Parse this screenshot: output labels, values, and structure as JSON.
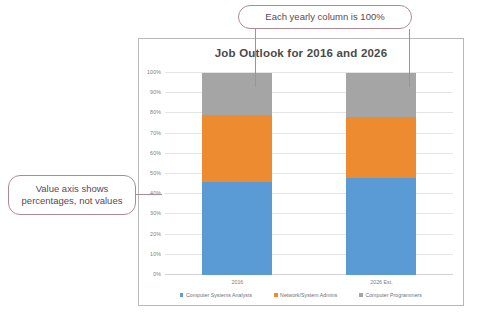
{
  "callouts": {
    "top": "Each yearly column is 100%",
    "left": "Value axis shows\npercentages, not values",
    "left_line1": "Value axis shows",
    "left_line2": "percentages, not values",
    "border_color": "#b08a93"
  },
  "chart_data": {
    "type": "bar",
    "stacked": true,
    "stacked_mode": "100%",
    "title": "Job Outlook for 2016 and 2026",
    "xlabel": "",
    "ylabel": "",
    "categories": [
      "2016",
      "2026 Est."
    ],
    "ylim": [
      0,
      100
    ],
    "ytick_labels": [
      "0%",
      "10%",
      "20%",
      "30%",
      "40%",
      "50%",
      "60%",
      "70%",
      "80%",
      "90%",
      "100%"
    ],
    "ytick_values": [
      0,
      10,
      20,
      30,
      40,
      50,
      60,
      70,
      80,
      90,
      100
    ],
    "grid": true,
    "legend_position": "bottom",
    "series": [
      {
        "name": "Computer Systems Analysts",
        "color": "#5B9BD5",
        "values": [
          46,
          48
        ]
      },
      {
        "name": "Network/System Admins",
        "color": "#ED8B30",
        "values": [
          33,
          30
        ]
      },
      {
        "name": "Computer Programmers",
        "color": "#A5A5A5",
        "values": [
          21,
          22
        ]
      }
    ]
  }
}
